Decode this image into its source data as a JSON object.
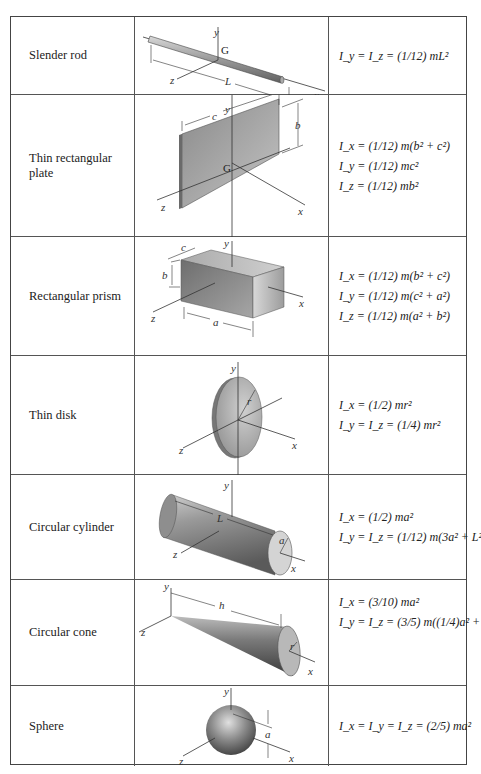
{
  "table": {
    "rows": [
      {
        "name": "Slender rod",
        "figure": {
          "shape": "slender-rod",
          "labels": [
            "y",
            "G",
            "z",
            "L",
            "x"
          ]
        },
        "formulas": [
          "I_y = I_z = (1/12) mL²"
        ]
      },
      {
        "name": "Thin rectangular plate",
        "figure": {
          "shape": "thin-rectangular-plate",
          "labels": [
            "y",
            "c",
            "b",
            "G",
            "z",
            "x"
          ]
        },
        "formulas": [
          "I_x = (1/12) m(b² + c²)",
          "I_y = (1/12) mc²",
          "I_z = (1/12) mb²"
        ]
      },
      {
        "name": "Rectangular prism",
        "figure": {
          "shape": "rectangular-prism",
          "labels": [
            "c",
            "y",
            "b",
            "z",
            "a",
            "x"
          ]
        },
        "formulas": [
          "I_x = (1/12) m(b² + c²)",
          "I_y = (1/12) m(c² + a²)",
          "I_z = (1/12) m(a² + b²)"
        ]
      },
      {
        "name": "Thin disk",
        "figure": {
          "shape": "thin-disk",
          "labels": [
            "y",
            "r",
            "z",
            "x"
          ]
        },
        "formulas": [
          "I_x = (1/2) mr²",
          "I_y = I_z = (1/4) mr²"
        ]
      },
      {
        "name": "Circular cylinder",
        "figure": {
          "shape": "circular-cylinder",
          "labels": [
            "y",
            "L",
            "a",
            "z",
            "x"
          ]
        },
        "formulas": [
          "I_x = (1/2) ma²",
          "I_y = I_z = (1/12) m(3a² + L²)"
        ]
      },
      {
        "name": "Circular cone",
        "figure": {
          "shape": "circular-cone",
          "labels": [
            "y",
            "h",
            "z",
            "r",
            "x"
          ]
        },
        "formulas": [
          "I_x = (3/10) ma²",
          "I_y = I_z = (3/5) m((1/4)a² + h²)"
        ]
      },
      {
        "name": "Sphere",
        "figure": {
          "shape": "sphere",
          "labels": [
            "y",
            "a",
            "z",
            "x"
          ]
        },
        "formulas": [
          "I_x = I_y = I_z = (2/5) ma²"
        ]
      }
    ]
  }
}
